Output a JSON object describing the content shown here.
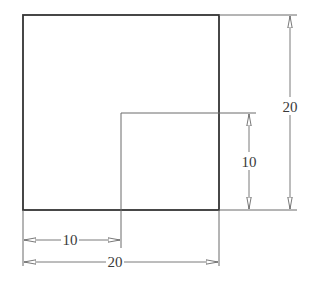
{
  "drawing": {
    "type": "technical-dimension-drawing",
    "colors": {
      "outline": "#333333",
      "thin_line": "#6a6a6a",
      "dimension_line": "#7a7a7a",
      "text": "#3a3a3a",
      "background": "#ffffff"
    },
    "square": {
      "x": 23,
      "y": 15,
      "width": 196,
      "height": 195
    },
    "inner_offset_lines": {
      "x": 121,
      "y": 113
    },
    "dimensions": {
      "right_outer": {
        "label": "20",
        "orientation": "vertical",
        "x": 290,
        "from": 15,
        "to": 210
      },
      "right_inner": {
        "label": "10",
        "orientation": "vertical",
        "x": 249,
        "from": 113,
        "to": 210
      },
      "bottom_inner": {
        "label": "10",
        "orientation": "horizontal",
        "y": 240,
        "from": 23,
        "to": 121
      },
      "bottom_outer": {
        "label": "20",
        "orientation": "horizontal",
        "y": 262,
        "from": 23,
        "to": 219
      }
    }
  }
}
